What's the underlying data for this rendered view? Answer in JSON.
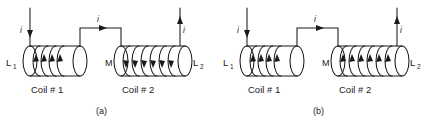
{
  "figure": {
    "background_color": "#ffffff",
    "line_color": "#1a1a1a",
    "panels": [
      {
        "id": "panel-a",
        "caption": "(a)",
        "left_inductor_label": "L",
        "left_inductor_sub": "1",
        "right_inductor_label": "L",
        "right_inductor_sub": "2",
        "mutual_label": "M",
        "coil1_caption": "Coil # 1",
        "coil2_caption": "Coil # 2",
        "current_in_label": "i",
        "current_mid_label": "i",
        "current_out_label": "i",
        "lead_in_direction": "down",
        "lead_mid_direction": "right",
        "lead_out_direction": "up",
        "coil1_turns": 4,
        "coil2_turns": 6,
        "coil1_winding_arrow_direction": "up",
        "coil2_winding_arrow_direction": "down"
      },
      {
        "id": "panel-b",
        "caption": "(b)",
        "left_inductor_label": "L",
        "left_inductor_sub": "1",
        "right_inductor_label": "L",
        "right_inductor_sub": "2",
        "mutual_label": "M",
        "coil1_caption": "Coil # 1",
        "coil2_caption": "Coil # 2",
        "current_in_label": "i",
        "current_mid_label": "i",
        "current_out_label": "i",
        "lead_in_direction": "down",
        "lead_mid_direction": "right",
        "lead_out_direction": "up",
        "coil1_turns": 4,
        "coil2_turns": 6,
        "coil1_winding_arrow_direction": "up",
        "coil2_winding_arrow_direction": "up"
      }
    ]
  }
}
